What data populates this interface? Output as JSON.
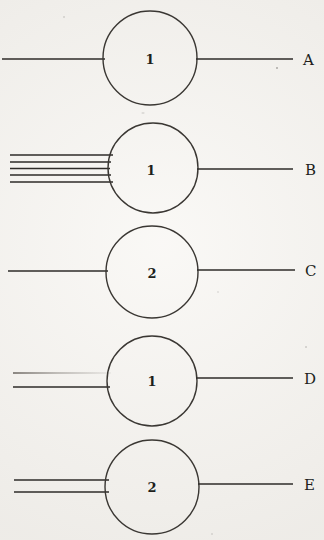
{
  "figure": {
    "paper_color": "#f7f5f1",
    "ink_color": "#2e2b28",
    "circle_ink_color": "#3a3733",
    "label_color": "#201e1b",
    "faded_ink_color": "#46403a",
    "rows": [
      {
        "label": "A",
        "cell_number": "1",
        "circle": {
          "cx": 150,
          "cy": 58,
          "r": 47
        },
        "number_pos": {
          "x": 150,
          "y": 60
        },
        "input_lines": [
          {
            "x1": 2,
            "x2": 105,
            "y": 59,
            "faded": false
          }
        ],
        "output_line": {
          "x1": 196,
          "x2": 293,
          "y": 59
        },
        "label_pos": {
          "x": 303,
          "y": 65
        }
      },
      {
        "label": "B",
        "cell_number": "1",
        "circle": {
          "cx": 153,
          "cy": 168,
          "r": 45
        },
        "number_pos": {
          "x": 151,
          "y": 171
        },
        "input_lines": [
          {
            "x1": 10,
            "x2": 113,
            "y": 155,
            "faded": false
          },
          {
            "x1": 10,
            "x2": 111,
            "y": 162,
            "faded": false
          },
          {
            "x1": 10,
            "x2": 110,
            "y": 168.5,
            "faded": false
          },
          {
            "x1": 10,
            "x2": 111,
            "y": 175,
            "faded": false
          },
          {
            "x1": 10,
            "x2": 113,
            "y": 182,
            "faded": false
          }
        ],
        "output_line": {
          "x1": 197,
          "x2": 293,
          "y": 169
        },
        "label_pos": {
          "x": 305,
          "y": 175
        }
      },
      {
        "label": "C",
        "cell_number": "2",
        "circle": {
          "cx": 152,
          "cy": 272,
          "r": 46
        },
        "number_pos": {
          "x": 152,
          "y": 274
        },
        "input_lines": [
          {
            "x1": 8,
            "x2": 108,
            "y": 271,
            "faded": false
          }
        ],
        "output_line": {
          "x1": 197,
          "x2": 295,
          "y": 270
        },
        "label_pos": {
          "x": 305,
          "y": 276
        }
      },
      {
        "label": "D",
        "cell_number": "1",
        "circle": {
          "cx": 152,
          "cy": 381,
          "r": 45
        },
        "number_pos": {
          "x": 152,
          "y": 382
        },
        "input_lines": [
          {
            "x1": 13,
            "x2": 111,
            "y": 373,
            "faded": true
          },
          {
            "x1": 13,
            "x2": 110,
            "y": 387,
            "faded": false
          }
        ],
        "output_line": {
          "x1": 196,
          "x2": 293,
          "y": 378
        },
        "label_pos": {
          "x": 304,
          "y": 384
        }
      },
      {
        "label": "E",
        "cell_number": "2",
        "circle": {
          "cx": 152,
          "cy": 487,
          "r": 47
        },
        "number_pos": {
          "x": 152,
          "y": 488
        },
        "input_lines": [
          {
            "x1": 14,
            "x2": 109,
            "y": 480,
            "faded": false
          },
          {
            "x1": 14,
            "x2": 109,
            "y": 492,
            "faded": false
          }
        ],
        "output_line": {
          "x1": 198,
          "x2": 293,
          "y": 484
        },
        "label_pos": {
          "x": 304,
          "y": 490
        }
      }
    ]
  }
}
